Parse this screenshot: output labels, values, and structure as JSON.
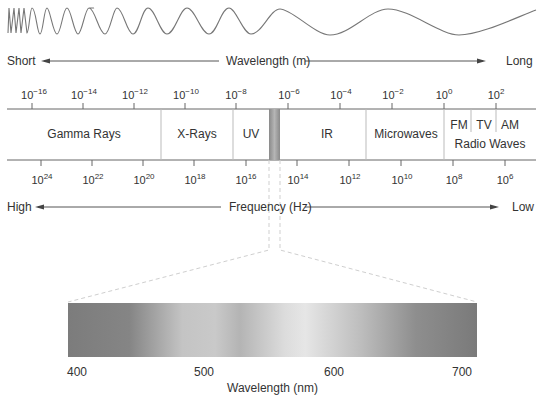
{
  "wavelength_axis": {
    "left_label": "Short",
    "center_label": "Wavelength (m)",
    "right_label": "Long",
    "ticks": [
      {
        "base": "10",
        "exp": "−16",
        "x": 34
      },
      {
        "base": "10",
        "exp": "−14",
        "x": 84
      },
      {
        "base": "10",
        "exp": "−12",
        "x": 135
      },
      {
        "base": "10",
        "exp": "−10",
        "x": 186
      },
      {
        "base": "10",
        "exp": "−8",
        "x": 236
      },
      {
        "base": "10",
        "exp": "−6",
        "x": 289
      },
      {
        "base": "10",
        "exp": "−4",
        "x": 341
      },
      {
        "base": "10",
        "exp": "−2",
        "x": 393
      },
      {
        "base": "10",
        "exp": "0",
        "x": 444
      },
      {
        "base": "10",
        "exp": "2",
        "x": 496
      }
    ]
  },
  "bands": [
    {
      "label": "Gamma Rays",
      "x": 84
    },
    {
      "label": "X-Rays",
      "x": 197
    },
    {
      "label": "UV",
      "x": 251
    },
    {
      "label": "IR",
      "x": 327
    },
    {
      "label": "Microwaves",
      "x": 406
    },
    {
      "label": "FM",
      "x": 459
    },
    {
      "label": "TV",
      "x": 484
    },
    {
      "label": "AM",
      "x": 510
    }
  ],
  "radio_label": "Radio Waves",
  "frequency_axis": {
    "left_label": "High",
    "center_label": "Frequency (Hz)",
    "right_label": "Low",
    "ticks": [
      {
        "base": "10",
        "exp": "24",
        "x": 42
      },
      {
        "base": "10",
        "exp": "22",
        "x": 93
      },
      {
        "base": "10",
        "exp": "20",
        "x": 144
      },
      {
        "base": "10",
        "exp": "18",
        "x": 195
      },
      {
        "base": "10",
        "exp": "16",
        "x": 246
      },
      {
        "base": "10",
        "exp": "14",
        "x": 298
      },
      {
        "base": "10",
        "exp": "12",
        "x": 350
      },
      {
        "base": "10",
        "exp": "10",
        "x": 402
      },
      {
        "base": "10",
        "exp": "8",
        "x": 454
      },
      {
        "base": "10",
        "exp": "6",
        "x": 505
      }
    ]
  },
  "visible_spectrum": {
    "ticks": [
      {
        "label": "400",
        "x": 77
      },
      {
        "label": "500",
        "x": 204
      },
      {
        "label": "600",
        "x": 334
      },
      {
        "label": "700",
        "x": 462
      }
    ],
    "axis_label": "Wavelength (nm)"
  },
  "colors": {
    "line": "#666666",
    "divider": "#bbbbbb",
    "visible_band": "#9a9a9a",
    "dash": "#c8c8c8"
  }
}
